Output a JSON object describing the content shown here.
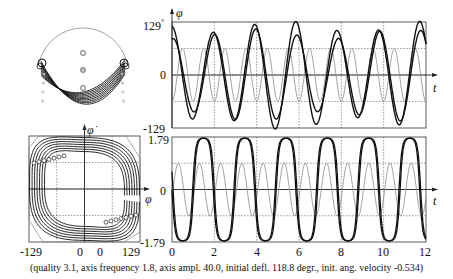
{
  "caption": "(quality 3.1,  axis frequency  1.8, axis ampl. 40.0,  initial defl. 118.8 degr.,  init. ang. velocity -0.534)",
  "colors": {
    "trace": "#111111",
    "drive": "#8a8a8a",
    "grid": "#555555",
    "frame": "#333333"
  },
  "chart_data": [
    {
      "id": "pendulum-view",
      "type": "diagram",
      "title": "",
      "description": "Pendulum bob trajectories drawn inside a circle with three axis markers"
    },
    {
      "id": "phi-vs-t",
      "type": "line",
      "title": "",
      "xlabel": "t",
      "ylabel": "φ",
      "ylim": [
        -129,
        129
      ],
      "xlim": [
        0,
        12
      ],
      "yticks": [
        "129°",
        "0",
        "-129"
      ],
      "grid": true,
      "series": [
        {
          "name": "phi (trace 1)",
          "style": "thick",
          "amplitude": 118,
          "period": 1.95
        },
        {
          "name": "phi (trace 2)",
          "style": "thick",
          "amplitude": 100,
          "period": 1.95
        },
        {
          "name": "axis drive",
          "style": "thin-gray",
          "amplitude": 40,
          "period": 1.0
        }
      ]
    },
    {
      "id": "phase-portrait",
      "type": "scatter",
      "title": "",
      "xlabel": "φ",
      "ylabel": "φ̇",
      "xlim": [
        -129,
        129
      ],
      "ylim": [
        -1.79,
        1.79
      ],
      "xticks": [
        "-129",
        "0",
        "0",
        "129"
      ],
      "grid": true
    },
    {
      "id": "phidot-vs-t",
      "type": "line",
      "title": "",
      "xlabel": "t",
      "ylabel": "",
      "ylim": [
        -1.79,
        1.79
      ],
      "xlim": [
        0,
        12
      ],
      "yticks": [
        "1.79",
        "0",
        "-1.79"
      ],
      "xticks": [
        "0",
        "2",
        "4",
        "6",
        "8",
        "10",
        "12"
      ],
      "grid": true,
      "series": [
        {
          "name": "phi-dot",
          "style": "thick",
          "amplitude": 1.79,
          "period": 1.95
        },
        {
          "name": "axis drive",
          "style": "thin-gray",
          "amplitude": 0.9,
          "period": 1.0
        }
      ]
    }
  ],
  "labels": {
    "top_y_max": "129",
    "top_y_deg": "°",
    "top_y_zero": "0",
    "top_y_min": "-129",
    "phi": "φ",
    "phidot": "φ̇",
    "t": "t",
    "bot_y_max": "1.79",
    "bot_y_zero": "0",
    "bot_y_min": "-1.79",
    "phase_x_min": "-129",
    "phase_x_zero_a": "0",
    "phase_x_zero_b": "0",
    "phase_x_max": "129",
    "x_ticks": [
      "0",
      "2",
      "4",
      "6",
      "8",
      "10",
      "12"
    ]
  }
}
